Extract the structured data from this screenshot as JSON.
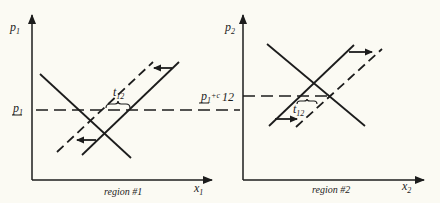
{
  "diagram": {
    "type": "two-region supply/demand price equilibrium diagram",
    "panels": [
      {
        "id": "region1",
        "caption": "region #1",
        "y_axis_label": "p",
        "y_axis_sub": "1",
        "x_axis_label": "x",
        "x_axis_sub": "1",
        "price_level_label": "p",
        "price_level_sub": "1",
        "price_level_underline": true,
        "transport_cost_label": "t",
        "transport_cost_sub": "12",
        "shift_direction": "left",
        "curves": [
          "demand (downward sloping, solid)",
          "supply (upward sloping, solid)",
          "shifted excess supply (dashed)"
        ]
      },
      {
        "id": "region2",
        "caption": "region #2",
        "y_axis_label": "p",
        "y_axis_sub": "2",
        "x_axis_label": "x",
        "x_axis_sub": "2",
        "price_level_label": "p",
        "price_level_sub": "1",
        "price_level_suffix": "+c",
        "price_level_suffix_sub": "12",
        "price_level_underline": true,
        "transport_cost_label": "t",
        "transport_cost_sub": "12",
        "shift_direction": "right",
        "curves": [
          "demand (downward sloping, solid)",
          "supply (upward sloping, solid)",
          "shifted supply (dashed)"
        ]
      }
    ]
  }
}
